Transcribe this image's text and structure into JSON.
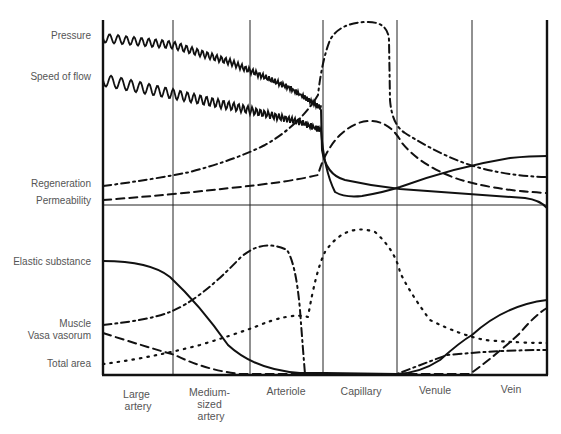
{
  "figure": {
    "width": 561,
    "height": 434,
    "plot": {
      "left": 103,
      "right": 547,
      "top": 20,
      "divider": 205,
      "bottom": 375
    },
    "column_lines_x": [
      103,
      173,
      250,
      323,
      397,
      472,
      547
    ]
  },
  "chart_data": {
    "type": "line",
    "title": "",
    "xlabel": "",
    "ylabel": "",
    "grid": true,
    "categories": [
      "Large artery",
      "Medium-sized artery",
      "Arteriole",
      "Capillary",
      "Venule",
      "Vein"
    ],
    "category_label_lines": [
      [
        "Large",
        "artery"
      ],
      [
        "Medium-",
        "sized",
        "artery"
      ],
      [
        "Arteriole"
      ],
      [
        "Capillary"
      ],
      [
        "Venule"
      ],
      [
        "Vein"
      ]
    ],
    "panels": [
      {
        "name": "upper",
        "series": [
          {
            "name": "Pressure",
            "style": "wavy-solid",
            "label_y": 36,
            "description": "High pulsatile, declines gradually, drops sharply at start of capillary, then steadily declines to vein",
            "values": [
              92,
              88,
              74,
              35,
              18,
              8
            ]
          },
          {
            "name": "Speed of flow",
            "style": "wavy-solid",
            "label_y": 77,
            "description": "Pulsatile, declines, drops sharply at capillary to minimum, then rises toward vein",
            "values": [
              74,
              68,
              55,
              6,
              18,
              28
            ]
          },
          {
            "name": "Regeneration",
            "style": "dash-dot",
            "label_y": 184,
            "description": "Low, rises through arteriole, very high plateau in capillary, decreases through venule to vein",
            "values": [
              12,
              17,
              35,
              97,
              30,
              13
            ]
          },
          {
            "name": "Permeability",
            "style": "dashed",
            "label_y": 200,
            "description": "Low, rises at arteriole, peaks in capillary, declines through venule to vein",
            "values": [
              4,
              8,
              16,
              47,
              18,
              8
            ]
          }
        ]
      },
      {
        "name": "lower",
        "series": [
          {
            "name": "Elastic substance",
            "style": "solid",
            "label_y": 262,
            "description": "High in large artery, falls through medium artery to near zero at arteriole/capillary, rises in venule and vein",
            "values": [
              68,
              40,
              4,
              0,
              12,
              45
            ]
          },
          {
            "name": "Muscle",
            "style": "dash-dot",
            "label_y": 324,
            "description": "Moderate, rising to peak in arteriole, drops to zero at capillary, low rising in venule/vein",
            "values": [
              32,
              45,
              70,
              0,
              10,
              14
            ]
          },
          {
            "name": "Vasa vasorum",
            "style": "dashed",
            "label_y": 341,
            "description": "Present in large artery decreasing to zero by arteriole, reappears and rises in vein",
            "values": [
              28,
              8,
              0,
              0,
              0,
              30
            ]
          },
          {
            "name": "Total area",
            "style": "dotted",
            "label_y": 364,
            "description": "Small in arteries, rises in arteriole, peaks in capillary, declines through venule, low in vein",
            "values": [
              6,
              12,
              28,
              92,
              22,
              12
            ]
          }
        ]
      }
    ]
  }
}
